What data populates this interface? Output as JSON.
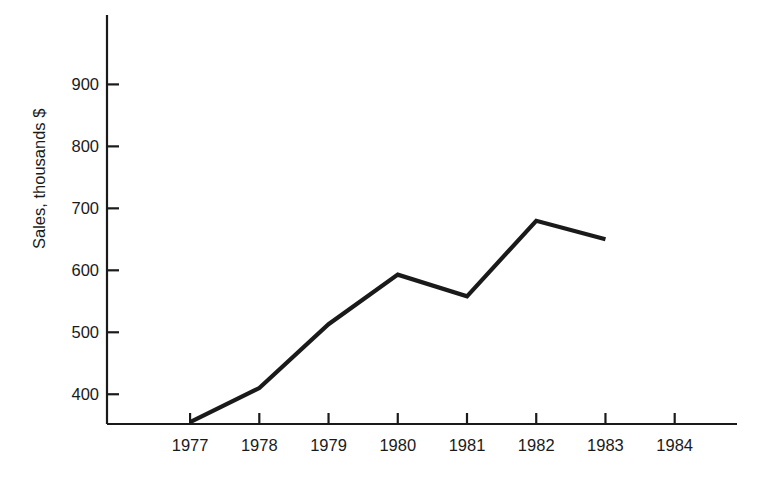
{
  "chart_data": {
    "type": "line",
    "title": "",
    "subtitle": "",
    "xlabel": "",
    "ylabel": "Sales, thousands $",
    "x": [
      1977,
      1978,
      1979,
      1980,
      1981,
      1982,
      1983
    ],
    "categories": [
      "1977",
      "1978",
      "1979",
      "1980",
      "1981",
      "1982",
      "1983"
    ],
    "values": [
      355,
      410,
      513,
      593,
      558,
      680,
      650
    ],
    "series": [
      {
        "name": "Sales",
        "values": [
          355,
          410,
          513,
          593,
          558,
          680,
          650
        ]
      }
    ],
    "xtick_labels": [
      "1977",
      "1978",
      "1979",
      "1980",
      "1981",
      "1982",
      "1983",
      "1984"
    ],
    "xtick_values": [
      1977,
      1978,
      1979,
      1980,
      1981,
      1982,
      1983,
      1984
    ],
    "ytick_labels": [
      "400",
      "500",
      "600",
      "700",
      "800",
      "900"
    ],
    "ytick_values": [
      400,
      500,
      600,
      700,
      800,
      900
    ],
    "xlim": [
      1975.8,
      1984.9
    ],
    "ylim": [
      352,
      1012
    ],
    "grid": false,
    "legend": false,
    "legend_position": "none",
    "annotations": [],
    "line_color": "#1a1a1a",
    "axis_color": "#1a1a1a",
    "background_color": "#ffffff",
    "markers": false
  },
  "axes": {
    "y_title": "Sales, thousands $",
    "y_ticks": [
      {
        "label": "900",
        "value": 900
      },
      {
        "label": "800",
        "value": 800
      },
      {
        "label": "700",
        "value": 700
      },
      {
        "label": "600",
        "value": 600
      },
      {
        "label": "500",
        "value": 500
      },
      {
        "label": "400",
        "value": 400
      }
    ],
    "x_ticks": [
      {
        "label": "1977",
        "value": 1977
      },
      {
        "label": "1978",
        "value": 1978
      },
      {
        "label": "1979",
        "value": 1979
      },
      {
        "label": "1980",
        "value": 1980
      },
      {
        "label": "1981",
        "value": 1981
      },
      {
        "label": "1982",
        "value": 1982
      },
      {
        "label": "1983",
        "value": 1983
      },
      {
        "label": "1984",
        "value": 1984
      }
    ]
  }
}
